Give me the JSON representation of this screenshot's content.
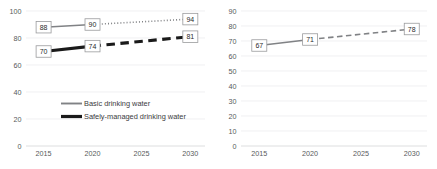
{
  "chart_data": [
    {
      "id": "left",
      "type": "line",
      "title": "",
      "xlabel": "",
      "ylabel": "",
      "x": [
        2015,
        2020,
        2025,
        2030
      ],
      "xticks": [
        "2015",
        "2020",
        "2025",
        "2030"
      ],
      "xlim": [
        2013.2,
        2031.5
      ],
      "ylim": [
        0,
        100
      ],
      "yticks": [
        "0",
        "20",
        "40",
        "60",
        "80",
        "100"
      ],
      "ytick_values": [
        0,
        20,
        40,
        60,
        80,
        100
      ],
      "grid": true,
      "legend_position": "center",
      "series": [
        {
          "name": "Basic drinking water",
          "color": "#808285",
          "style": "thin",
          "observed": {
            "x": [
              2015,
              2020
            ],
            "values": [
              88,
              90
            ],
            "linestyle": "solid"
          },
          "projected": {
            "x": [
              2020,
              2030
            ],
            "values": [
              90,
              94
            ],
            "linestyle": "dotted"
          },
          "labels": [
            {
              "x": 2015,
              "value": 88,
              "text": "88"
            },
            {
              "x": 2020,
              "value": 90,
              "text": "90"
            },
            {
              "x": 2030,
              "value": 94,
              "text": "94"
            }
          ]
        },
        {
          "name": "Safely-managed drinking water",
          "color": "#1a1a1a",
          "style": "thick",
          "observed": {
            "x": [
              2015,
              2020
            ],
            "values": [
              70,
              74
            ],
            "linestyle": "solid"
          },
          "projected": {
            "x": [
              2020,
              2030
            ],
            "values": [
              74,
              81
            ],
            "linestyle": "dashed"
          },
          "labels": [
            {
              "x": 2015,
              "value": 70,
              "text": "70"
            },
            {
              "x": 2020,
              "value": 74,
              "text": "74"
            },
            {
              "x": 2030,
              "value": 81,
              "text": "81"
            }
          ]
        }
      ],
      "legend": [
        {
          "label": "Basic drinking water",
          "color": "#808285",
          "style": "thin"
        },
        {
          "label": "Safely-managed drinking water",
          "color": "#1a1a1a",
          "style": "thick"
        }
      ]
    },
    {
      "id": "right",
      "type": "line",
      "title": "",
      "xlabel": "",
      "ylabel": "",
      "x": [
        2015,
        2020,
        2025,
        2030
      ],
      "xticks": [
        "2015",
        "2020",
        "2025",
        "2030"
      ],
      "xlim": [
        2013.2,
        2031.5
      ],
      "ylim": [
        0,
        90
      ],
      "yticks": [
        "0",
        "10",
        "20",
        "30",
        "40",
        "50",
        "60",
        "70",
        "80",
        "90"
      ],
      "ytick_values": [
        0,
        10,
        20,
        30,
        40,
        50,
        60,
        70,
        80,
        90
      ],
      "grid": true,
      "legend_position": "none",
      "series": [
        {
          "name": "",
          "color": "#6d6e71",
          "style": "thin",
          "observed": {
            "x": [
              2015,
              2020
            ],
            "values": [
              67,
              71
            ],
            "linestyle": "solid"
          },
          "projected": {
            "x": [
              2020,
              2030
            ],
            "values": [
              71,
              78
            ],
            "linestyle": "dashed"
          },
          "labels": [
            {
              "x": 2015,
              "value": 67,
              "text": "67"
            },
            {
              "x": 2020,
              "value": 71,
              "text": "71"
            },
            {
              "x": 2030,
              "value": 78,
              "text": "78"
            }
          ]
        }
      ],
      "legend": []
    }
  ]
}
